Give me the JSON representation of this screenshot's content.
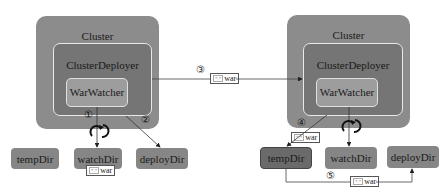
{
  "left_diagram": {
    "cluster": "Cluster",
    "deployer": "ClusterDeployer",
    "watcher": "WarWatcher",
    "dirs": [
      "tempDir",
      "watchDir",
      "deployDir"
    ],
    "steps": [
      "①",
      "②"
    ],
    "war_label": "war",
    "war_ext": "*.*"
  },
  "right_diagram": {
    "cluster": "Cluster",
    "deployer": "ClusterDeployer",
    "watcher": "WarWatcher",
    "dirs": [
      "tempDir",
      "watchDir",
      "deployDir"
    ],
    "steps": [
      "④",
      "⑤"
    ],
    "war_label": "war",
    "war_ext": "*.*"
  },
  "transfer": {
    "step": "③",
    "war_label": "war",
    "war_ext": "*.*"
  },
  "colors": {
    "cluster": "#8c8c8c",
    "deployer": "#757575",
    "watcher": "#9d9d9d",
    "dir": "#868686",
    "highlighted_dir": "#6a6a6a"
  }
}
